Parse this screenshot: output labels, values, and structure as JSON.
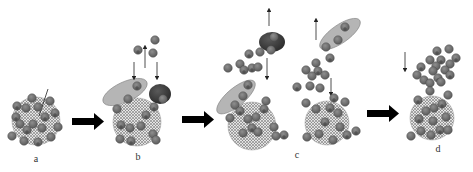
{
  "figure": {
    "panels": [
      {
        "id": "a",
        "label": "a"
      },
      {
        "id": "b",
        "label": "b"
      },
      {
        "id": "c",
        "label": "c"
      },
      {
        "id": "d",
        "label": "d"
      }
    ],
    "colors": {
      "particle_fill": "#6b6b6b",
      "particle_stroke": "#4a4a4a",
      "particle_highlight": "#9a9a9a",
      "core_fill": "#d9d9d9",
      "core_dots": "#3a3a3a",
      "carrier_fill": "#b3b3b3",
      "carrier_stroke": "#7a7a7a",
      "dark_blob_fill": "#3c3c3c",
      "arrow_color": "#222222",
      "big_arrow_color": "#000000"
    }
  }
}
